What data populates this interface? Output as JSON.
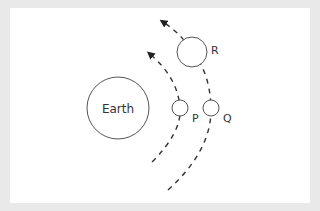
{
  "diagram": {
    "colors": {
      "background": "#e9e9e9",
      "panel": "#ffffff",
      "stroke": "#444444",
      "text": "#333333"
    },
    "bodies": [
      {
        "id": "earth",
        "label": "Earth",
        "cx": 118,
        "cy": 108,
        "r": 31
      },
      {
        "id": "P",
        "label": "P",
        "cx": 180,
        "cy": 108,
        "r": 8
      },
      {
        "id": "Q",
        "label": "Q",
        "cx": 211,
        "cy": 108,
        "r": 8
      },
      {
        "id": "R",
        "label": "R",
        "cx": 192,
        "cy": 52,
        "r": 15
      }
    ],
    "orbits": [
      {
        "id": "inner-orbit",
        "passes_through": [
          "P"
        ],
        "direction": "counter-clockwise (upward)"
      },
      {
        "id": "outer-orbit",
        "passes_through": [
          "Q",
          "R"
        ],
        "direction": "counter-clockwise (upward)"
      }
    ]
  }
}
